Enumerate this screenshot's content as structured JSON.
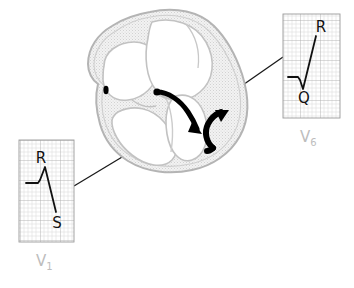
{
  "figure": {
    "kind": "medical-illustration",
    "background_color": "#ffffff"
  },
  "heart": {
    "name": "heart-four-chamber-cross-section",
    "outline_color": "#b4b4b4",
    "chamber_fill": "#ffffff",
    "myocardium_fill": "#efefef",
    "vessel_dot_color": "#000000",
    "arrows": [
      {
        "name": "septal-depolarization-arrow",
        "direction": "left-to-right-downward",
        "color": "#000000"
      },
      {
        "name": "free-wall-depolarization-arrow",
        "direction": "upward-curving",
        "color": "#000000"
      }
    ]
  },
  "connectors": [
    {
      "name": "connector-to-v1",
      "color": "#1a1a1a",
      "from": "heart-septum-left",
      "to": "v1-panel"
    },
    {
      "name": "connector-to-v6",
      "color": "#1a1a1a",
      "from": "heart-lateral-wall",
      "to": "v6-panel"
    }
  ],
  "ecg_panels": [
    {
      "id": "v1",
      "lead_label": "V",
      "lead_subscript": "1",
      "label_color": "#bdbdbd",
      "grid": {
        "minor_color": "#dcdcdc",
        "major_color": "#b0b0b0",
        "minor_step_px": 4,
        "major_every": 5,
        "border_color": "#9a9a9a"
      },
      "trace_color": "#111111",
      "waves": [
        {
          "name": "r-wave",
          "letter": "R",
          "morphology": "small-positive-deflection"
        },
        {
          "name": "s-wave",
          "letter": "S",
          "morphology": "deep-negative-deflection"
        }
      ],
      "pattern_description": "small R, deep S"
    },
    {
      "id": "v6",
      "lead_label": "V",
      "lead_subscript": "6",
      "label_color": "#bdbdbd",
      "grid": {
        "minor_color": "#dcdcdc",
        "major_color": "#b0b0b0",
        "minor_step_px": 4,
        "major_every": 5,
        "border_color": "#9a9a9a"
      },
      "trace_color": "#111111",
      "waves": [
        {
          "name": "q-wave",
          "letter": "Q",
          "morphology": "small-negative-deflection"
        },
        {
          "name": "r-wave",
          "letter": "R",
          "morphology": "tall-positive-deflection"
        }
      ],
      "pattern_description": "small Q, tall R"
    }
  ]
}
